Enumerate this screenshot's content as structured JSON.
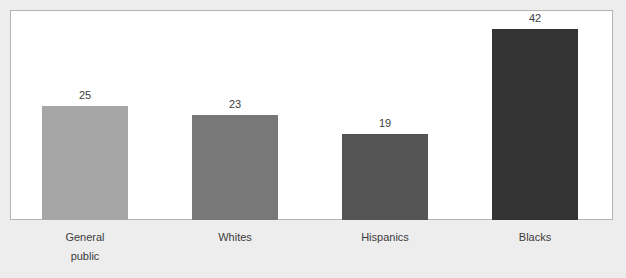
{
  "chart_data": {
    "type": "bar",
    "title": "",
    "xlabel": "",
    "ylabel": "",
    "ylim": [
      0,
      46
    ],
    "grid": false,
    "legend": "none",
    "categories": [
      "General public",
      "Whites",
      "Hispanics",
      "Blacks"
    ],
    "category_lines": [
      [
        "General",
        "public"
      ],
      [
        "Whites"
      ],
      [
        "Hispanics"
      ],
      [
        "Blacks"
      ]
    ],
    "values": [
      25,
      23,
      19,
      42
    ],
    "value_labels": [
      "25",
      "23",
      "19",
      "42"
    ],
    "bar_colors": [
      "#a6a6a6",
      "#787878",
      "#545454",
      "#333333"
    ]
  },
  "styles": {
    "page_background": "#ededed",
    "plot_background": "#ffffff",
    "plot_border": "#b4b4b4",
    "text_color": "#3c3c3c"
  }
}
